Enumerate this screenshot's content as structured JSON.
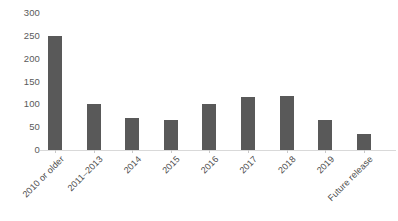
{
  "chart_data": {
    "type": "bar",
    "title": "",
    "subtitle": "",
    "xlabel": "",
    "ylabel": "",
    "categories": [
      "2010 or older",
      "2011–2013",
      "2014",
      "2015",
      "2016",
      "2017",
      "2018",
      "2019",
      "Future release"
    ],
    "values": [
      250,
      100,
      70,
      65,
      100,
      115,
      118,
      65,
      35
    ],
    "ylim": [
      0,
      300
    ],
    "y_ticks": [
      0,
      50,
      100,
      150,
      200,
      250,
      300
    ],
    "y_tick_labels": [
      "0",
      "50",
      "100",
      "150",
      "200",
      "250",
      "300"
    ],
    "grid": false,
    "legend": false,
    "legend_position": "none",
    "bar_color": "#595959",
    "axis_color": "#d9d9d9",
    "tick_label_color": "#595959",
    "background_color": "#ffffff",
    "x_label_rotation_degrees": -45
  }
}
